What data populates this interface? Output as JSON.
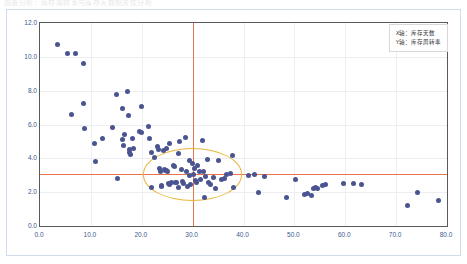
{
  "top_strip": {
    "ghost_text": "图表分析：库存周转率与库存天数相关性分析"
  },
  "legend": {
    "lines": [
      "X轴：库存天数",
      "Y轴：库存周转率"
    ]
  },
  "colors": {
    "marker": "#4a5490",
    "reference_line": "#e8744b",
    "highlight_circle": "#e8b63c",
    "grid": "#edeef2",
    "axis": "#595959",
    "tick_label": "#3b5a8c",
    "outer_frame": "#cfdcec"
  },
  "chart_data": {
    "type": "scatter",
    "title": "",
    "xlabel": "X轴：库存天数",
    "ylabel": "Y轴：库存周转率",
    "xlim": [
      0.0,
      80.0
    ],
    "ylim": [
      0.0,
      12.0
    ],
    "xticks": [
      0.0,
      10.0,
      20.0,
      30.0,
      40.0,
      50.0,
      60.0,
      70.0,
      80.0
    ],
    "yticks": [
      0.0,
      2.0,
      4.0,
      6.0,
      8.0,
      10.0,
      12.0
    ],
    "xtick_labels": [
      "0.0",
      "10.0",
      "20.0",
      "30.0",
      "40.0",
      "50.0",
      "60.0",
      "70.0",
      "80.0"
    ],
    "ytick_labels": [
      "0.0",
      "2.0",
      "4.0",
      "6.0",
      "8.0",
      "10.0",
      "12.0"
    ],
    "grid": true,
    "legend_position": "top-right",
    "annotations": [
      {
        "kind": "vline",
        "x": 30.0,
        "color": "#e8744b"
      },
      {
        "kind": "hline",
        "y": 3.05,
        "color": "#e8744b"
      },
      {
        "kind": "circle",
        "cx": 30.0,
        "cy": 3.05,
        "rx": 9.8,
        "ry": 1.55,
        "color": "#e8b63c"
      }
    ],
    "series": [
      {
        "name": "库存指标",
        "marker": "circle",
        "color": "#4a5490",
        "points": [
          [
            3.5,
            10.75
          ],
          [
            5.4,
            10.2
          ],
          [
            7.0,
            10.2
          ],
          [
            8.5,
            9.6
          ],
          [
            6.2,
            6.6
          ],
          [
            8.6,
            7.25
          ],
          [
            8.8,
            5.75
          ],
          [
            10.7,
            4.9
          ],
          [
            10.9,
            3.8
          ],
          [
            12.3,
            5.2
          ],
          [
            14.3,
            5.85
          ],
          [
            15.0,
            7.75
          ],
          [
            15.3,
            2.8
          ],
          [
            16.2,
            6.95
          ],
          [
            16.5,
            4.75
          ],
          [
            16.6,
            5.4
          ],
          [
            16.3,
            5.1
          ],
          [
            17.2,
            7.95
          ],
          [
            17.4,
            6.55
          ],
          [
            17.6,
            4.5
          ],
          [
            17.5,
            4.35
          ],
          [
            17.8,
            4.2
          ],
          [
            18.2,
            5.2
          ],
          [
            18.4,
            4.6
          ],
          [
            19.6,
            5.6
          ],
          [
            20.0,
            5.5
          ],
          [
            19.9,
            7.05
          ],
          [
            21.4,
            5.9
          ],
          [
            21.6,
            5.2
          ],
          [
            22.0,
            4.35
          ],
          [
            21.9,
            2.3
          ],
          [
            22.6,
            4.05
          ],
          [
            23.0,
            4.7
          ],
          [
            23.2,
            4.55
          ],
          [
            23.4,
            3.4
          ],
          [
            23.6,
            3.25
          ],
          [
            23.8,
            2.4
          ],
          [
            23.9,
            2.35
          ],
          [
            24.4,
            3.35
          ],
          [
            24.6,
            3.3
          ],
          [
            24.9,
            3.3
          ],
          [
            25.1,
            3.25
          ],
          [
            24.2,
            4.45
          ],
          [
            24.8,
            4.6
          ],
          [
            25.4,
            4.85
          ],
          [
            25.2,
            2.5
          ],
          [
            25.5,
            2.45
          ],
          [
            25.8,
            2.55
          ],
          [
            26.2,
            3.6
          ],
          [
            26.5,
            3.5
          ],
          [
            26.6,
            2.6
          ],
          [
            26.9,
            2.55
          ],
          [
            27.2,
            4.3
          ],
          [
            27.4,
            5.0
          ],
          [
            27.3,
            2.25
          ],
          [
            27.8,
            3.35
          ],
          [
            28.0,
            2.65
          ],
          [
            28.3,
            2.5
          ],
          [
            28.6,
            5.25
          ],
          [
            28.8,
            3.2
          ],
          [
            29.0,
            2.35
          ],
          [
            29.3,
            3.9
          ],
          [
            29.4,
            3.0
          ],
          [
            29.6,
            2.45
          ],
          [
            30.0,
            3.7
          ],
          [
            30.2,
            3.05
          ],
          [
            30.3,
            3.4
          ],
          [
            30.6,
            2.7
          ],
          [
            30.8,
            2.6
          ],
          [
            31.0,
            3.55
          ],
          [
            31.4,
            3.2
          ],
          [
            31.6,
            2.75
          ],
          [
            32.0,
            5.05
          ],
          [
            32.2,
            3.25
          ],
          [
            32.4,
            1.7
          ],
          [
            32.6,
            2.9
          ],
          [
            33.0,
            3.95
          ],
          [
            33.2,
            2.6
          ],
          [
            33.6,
            2.45
          ],
          [
            34.2,
            2.85
          ],
          [
            34.5,
            2.2
          ],
          [
            35.0,
            3.9
          ],
          [
            35.6,
            2.75
          ],
          [
            36.2,
            2.8
          ],
          [
            36.6,
            3.05
          ],
          [
            37.4,
            3.1
          ],
          [
            37.8,
            4.15
          ],
          [
            38.0,
            2.3
          ],
          [
            41.0,
            3.0
          ],
          [
            42.2,
            3.05
          ],
          [
            43.0,
            2.0
          ],
          [
            44.2,
            2.95
          ],
          [
            48.4,
            1.7
          ],
          [
            50.2,
            2.75
          ],
          [
            52.0,
            1.85
          ],
          [
            52.6,
            1.9
          ],
          [
            53.4,
            1.8
          ],
          [
            53.8,
            2.2
          ],
          [
            54.2,
            2.25
          ],
          [
            54.6,
            2.2
          ],
          [
            55.6,
            2.4
          ],
          [
            56.2,
            2.45
          ],
          [
            59.6,
            2.5
          ],
          [
            61.6,
            2.5
          ],
          [
            63.2,
            2.45
          ],
          [
            72.3,
            1.2
          ],
          [
            74.2,
            2.0
          ],
          [
            78.4,
            1.5
          ]
        ]
      }
    ]
  }
}
